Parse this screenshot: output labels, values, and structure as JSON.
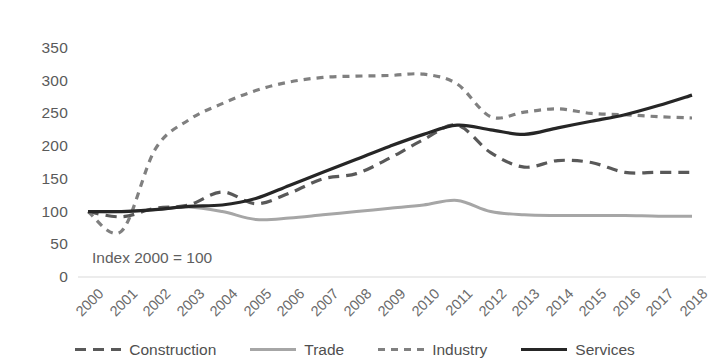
{
  "chart_data": {
    "type": "line",
    "title": "",
    "subtitle": "",
    "xlabel": "",
    "ylabel": "",
    "annotation": "Index 2000 = 100",
    "grid": false,
    "legend_position": "bottom",
    "xlim": [
      2000,
      2018
    ],
    "ylim": [
      0,
      350
    ],
    "ytick_step": 50,
    "ytick_labels": [
      "350",
      "300",
      "250",
      "200",
      "150",
      "100",
      "50",
      "0"
    ],
    "ytick_values": [
      350,
      300,
      250,
      200,
      150,
      100,
      50,
      0
    ],
    "categories": [
      "2000",
      "2001",
      "2002",
      "2003",
      "2004",
      "2005",
      "2006",
      "2007",
      "2008",
      "2009",
      "2010",
      "2011",
      "2012",
      "2013",
      "2014",
      "2015",
      "2016",
      "2017",
      "2018"
    ],
    "series": [
      {
        "name": "Construction",
        "color": "#595959",
        "style": "dashed",
        "dasharray": "11,7",
        "width": 3.2,
        "values": [
          100,
          92,
          105,
          110,
          130,
          112,
          128,
          150,
          158,
          182,
          210,
          232,
          190,
          168,
          178,
          175,
          160,
          160,
          160
        ]
      },
      {
        "name": "Trade",
        "color": "#a6a6a6",
        "style": "solid",
        "dasharray": "",
        "width": 3.0,
        "values": [
          100,
          100,
          103,
          107,
          100,
          88,
          90,
          95,
          100,
          105,
          110,
          117,
          100,
          95,
          94,
          94,
          94,
          93,
          93
        ]
      },
      {
        "name": "Industry",
        "color": "#808080",
        "style": "dashed",
        "dasharray": "7,6",
        "width": 3.2,
        "values": [
          100,
          70,
          195,
          240,
          265,
          285,
          298,
          305,
          307,
          308,
          310,
          295,
          245,
          252,
          257,
          250,
          248,
          245,
          243
        ]
      },
      {
        "name": "Services",
        "color": "#262626",
        "style": "solid",
        "dasharray": "",
        "width": 3.2,
        "values": [
          100,
          100,
          103,
          108,
          110,
          120,
          140,
          160,
          180,
          200,
          218,
          232,
          225,
          218,
          228,
          238,
          248,
          262,
          278
        ]
      }
    ]
  },
  "axis": {
    "baseline_color": "#d9d9d9"
  },
  "legend": {
    "items": [
      {
        "label": "Construction"
      },
      {
        "label": "Trade"
      },
      {
        "label": "Industry"
      },
      {
        "label": "Services"
      }
    ]
  }
}
